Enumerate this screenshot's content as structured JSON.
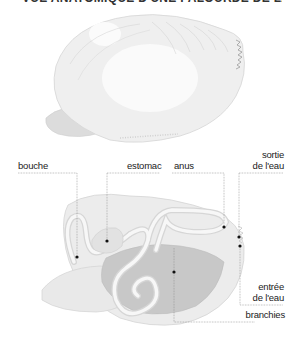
{
  "title": "VUE ANATOMIQUE D'UNE PALOURDE DE LA PRESSION",
  "labels": {
    "bouche": "bouche",
    "estomac": "estomac",
    "anus": "anus",
    "sortie_line1": "sortie",
    "sortie_line2": "de l'eau",
    "entree_line1": "entrée",
    "entree_line2": "de l'eau",
    "branchies": "branchies"
  },
  "colors": {
    "shell": "#ebebeb",
    "shell_outline": "#d8d8d8",
    "gills": "#c9c9c9",
    "body": "#e6e6e6",
    "leader_line": "#888888",
    "dot": "#111111",
    "text": "#222222"
  }
}
